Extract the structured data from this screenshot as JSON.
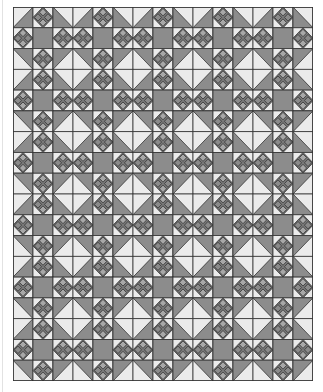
{
  "quilt": {
    "name": "quilt-pattern",
    "block_columns": 5,
    "block_rows": 6,
    "cells_per_block": 3,
    "width_px": 300,
    "height_px": 374,
    "block_layout": [
      [
        "hst-tl",
        "edge-diamond",
        "hst-tr"
      ],
      [
        "edge-diamond",
        "center-square",
        "edge-diamond"
      ],
      [
        "hst-bl",
        "edge-diamond",
        "hst-br"
      ]
    ],
    "colors": {
      "light": "#ebebeb",
      "dark": "#8c8c8c",
      "diamond_fill": "#7a7a7a",
      "diamond_light": "#a8a8a8",
      "diamond_dark": "#8a8a8a",
      "outline": "#333333"
    }
  }
}
